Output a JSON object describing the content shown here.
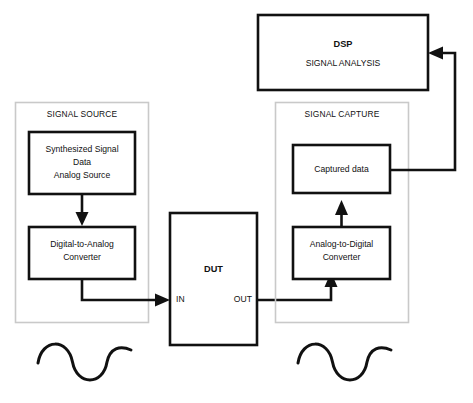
{
  "diagram": {
    "colors": {
      "line": "#111111",
      "panel_border": "#c9c9c9",
      "background": "#ffffff"
    },
    "panels": [
      {
        "id": "signal-source",
        "label": "SIGNAL SOURCE"
      },
      {
        "id": "signal-capture",
        "label": "SIGNAL CAPTURE"
      }
    ],
    "blocks": {
      "dsp": {
        "title": "DSP",
        "subtitle": "SIGNAL ANALYSIS"
      },
      "synthesized_source": {
        "line1": "Synthesized Signal",
        "line2": "Data",
        "line3": "Analog Source"
      },
      "dac": {
        "line1": "Digital-to-Analog",
        "line2": "Converter"
      },
      "dut": {
        "title": "DUT",
        "port_in": "IN",
        "port_out": "OUT"
      },
      "adc": {
        "line1": "Analog-to-Digital",
        "line2": "Converter"
      },
      "captured_data": {
        "line1": "Captured data"
      }
    },
    "waveforms": [
      {
        "id": "source-sine",
        "name": "sine-wave"
      },
      {
        "id": "capture-sine",
        "name": "sine-wave"
      }
    ]
  }
}
